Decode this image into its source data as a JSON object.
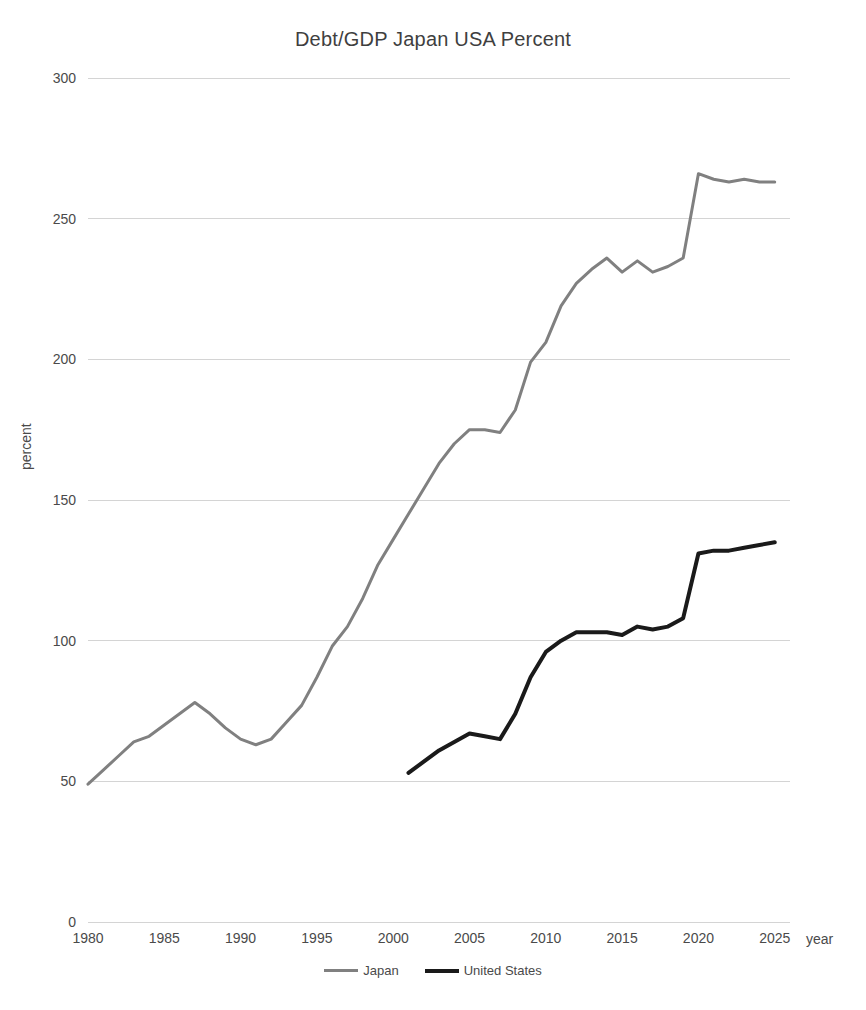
{
  "chart_data": {
    "type": "line",
    "title": "Debt/GDP Japan USA Percent",
    "xlabel": "year",
    "ylabel": "percent",
    "xlim": [
      1980,
      2026
    ],
    "ylim": [
      0,
      300
    ],
    "ytick_labels": [
      "300",
      "250",
      "200",
      "150",
      "100",
      "50",
      "0"
    ],
    "yticks": [
      300,
      250,
      200,
      150,
      100,
      50,
      0
    ],
    "xtick_labels": [
      "1980",
      "1985",
      "1990",
      "1995",
      "2000",
      "2005",
      "2010",
      "2015",
      "2020",
      "2025"
    ],
    "xticks": [
      1980,
      1985,
      1990,
      1995,
      2000,
      2005,
      2010,
      2015,
      2020,
      2025
    ],
    "grid": true,
    "legend_position": "bottom",
    "colors": {
      "japan": "#808080",
      "united_states": "#1a1a1a",
      "gridline": "#d4d4d4",
      "text": "#4a4a4a",
      "background": "#ffffff"
    },
    "series": [
      {
        "name": "Japan",
        "color": "#808080",
        "stroke_width": 3,
        "x": [
          1980,
          1981,
          1982,
          1983,
          1984,
          1985,
          1986,
          1987,
          1988,
          1989,
          1990,
          1991,
          1992,
          1993,
          1994,
          1995,
          1996,
          1997,
          1998,
          1999,
          2000,
          2001,
          2002,
          2003,
          2004,
          2005,
          2006,
          2007,
          2008,
          2009,
          2010,
          2011,
          2012,
          2013,
          2014,
          2015,
          2016,
          2017,
          2018,
          2019,
          2020,
          2021,
          2022,
          2023,
          2024,
          2025
        ],
        "values": [
          49,
          54,
          59,
          64,
          66,
          70,
          74,
          78,
          74,
          69,
          65,
          63,
          65,
          71,
          77,
          87,
          98,
          105,
          115,
          127,
          136,
          145,
          154,
          163,
          170,
          175,
          175,
          174,
          182,
          199,
          206,
          219,
          227,
          232,
          236,
          231,
          235,
          231,
          233,
          236,
          266,
          264,
          263,
          264,
          263,
          263
        ]
      },
      {
        "name": "United States",
        "color": "#1a1a1a",
        "stroke_width": 4,
        "x": [
          2001,
          2002,
          2003,
          2004,
          2005,
          2006,
          2007,
          2008,
          2009,
          2010,
          2011,
          2012,
          2013,
          2014,
          2015,
          2016,
          2017,
          2018,
          2019,
          2020,
          2021,
          2022,
          2023,
          2024,
          2025
        ],
        "values": [
          53,
          57,
          61,
          64,
          67,
          66,
          65,
          74,
          87,
          96,
          100,
          103,
          103,
          103,
          102,
          105,
          104,
          105,
          108,
          131,
          132,
          132,
          133,
          134,
          135
        ]
      }
    ],
    "annotations": []
  },
  "legend": {
    "items": [
      {
        "label": "Japan",
        "key": "japan"
      },
      {
        "label": "United States",
        "key": "usa"
      }
    ]
  }
}
